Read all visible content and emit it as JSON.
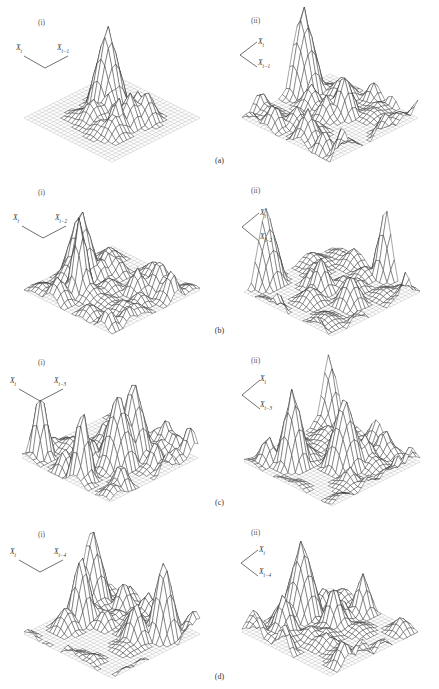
{
  "header": {
    "running_head": "",
    "folio": ""
  },
  "figure": {
    "type": "figure",
    "panel_label_i": "(i)",
    "panel_label_ii": "(ii)",
    "rows": [
      {
        "id": "a",
        "label": "(a)",
        "lag": 1,
        "axis_x": "X",
        "axis_x_sub": "t",
        "axis_y": "X",
        "axis_y_sub": "t−1",
        "panels": [
          {
            "view": "i",
            "caption": "(i)",
            "peak_count": 1,
            "peak_height": 0.97,
            "clustering": "single sharp central spike",
            "spread": 0.22
          },
          {
            "view": "ii",
            "caption": "(ii)",
            "peak_count": 1,
            "peak_height": 0.93,
            "clustering": "one dominant right spike over low ridge field",
            "spread": 0.62
          }
        ]
      },
      {
        "id": "b",
        "label": "(b)",
        "lag": 2,
        "axis_x": "X",
        "axis_x_sub": "t",
        "axis_y": "X",
        "axis_y_sub": "t−2",
        "panels": [
          {
            "view": "i",
            "caption": "(i)",
            "peak_count": 2,
            "peak_height": 0.9,
            "clustering": "tall central spike with dense surrounding spikes",
            "spread": 0.46
          },
          {
            "view": "ii",
            "caption": "(ii)",
            "peak_count": 2,
            "peak_height": 0.88,
            "clustering": "dominant right spike, broad rough field",
            "spread": 0.7
          }
        ]
      },
      {
        "id": "c",
        "label": "(c)",
        "lag": 3,
        "axis_x": "X",
        "axis_x_sub": "t",
        "axis_y": "X",
        "axis_y_sub": "t−3",
        "panels": [
          {
            "view": "i",
            "caption": "(i)",
            "peak_count": 4,
            "peak_height": 0.85,
            "clustering": "several comparable tall spikes across centre",
            "spread": 0.58
          },
          {
            "view": "ii",
            "caption": "(ii)",
            "peak_count": 3,
            "peak_height": 0.86,
            "clustering": "cluster of tall spikes right of centre",
            "spread": 0.66
          }
        ]
      },
      {
        "id": "d",
        "label": "(d)",
        "lag": 4,
        "axis_x": "X",
        "axis_x_sub": "t",
        "axis_y": "X",
        "axis_y_sub": "t−4",
        "panels": [
          {
            "view": "i",
            "caption": "(i)",
            "peak_count": 3,
            "peak_height": 0.88,
            "clustering": "tall left spike plus scattered medium spikes",
            "spread": 0.64
          },
          {
            "view": "ii",
            "caption": "(ii)",
            "peak_count": 1,
            "peak_height": 0.95,
            "clustering": "single tall spike with moderate surrounding field",
            "spread": 0.5
          }
        ]
      }
    ]
  },
  "chart_data": {
    "type": "surface",
    "title": "",
    "xlabel": "X_t",
    "ylabel": "X_{t-k}",
    "zlabel": "",
    "grid": true,
    "legend": "none",
    "projection": "isometric-wireframe",
    "grid_divisions": 24,
    "panel_count": 8,
    "rows": 4,
    "columns": 2,
    "column_views": [
      "(i)",
      "(ii)"
    ],
    "row_labels": [
      "(a)",
      "(b)",
      "(c)",
      "(d)"
    ],
    "lags": [
      1,
      2,
      3,
      4
    ],
    "note": "Eight isometric wireframe surface plots of a bivariate (joint) density over the lag plane X_t vs X_{t-k}; each row k = 1..4, two viewing orientations per row."
  }
}
